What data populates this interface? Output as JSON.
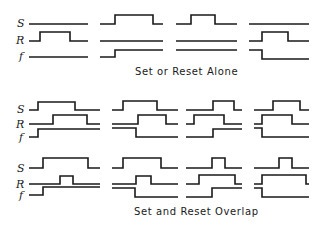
{
  "captions": {
    "top": "Set or Reset Alone",
    "bottom": "Set and Reset Overlap"
  },
  "signal_labels": [
    "S",
    "R",
    "f"
  ],
  "groups": [
    {
      "name": "set-or-reset-alone",
      "label_y": [
        27,
        44,
        60
      ],
      "panels": [
        {
          "S": "M29,24 H88",
          "R": "M29,41 H40 V32 H70 V41 H88",
          "f": "M29,57 H88"
        },
        {
          "S": "M100,24 H115 V15 H153 V24 H163",
          "R": "M100,41 H163",
          "f": "M100,57 H115 V50 H163"
        },
        {
          "S": "M176,24 H191 V15 H215 V24 H237",
          "R": "M176,41 H237",
          "f": "M176,50 H237"
        },
        {
          "S": "M249,24 H309",
          "R": "M249,41 H262 V32 H288 V41 H309",
          "f": "M249,50 H262 V59 H309"
        }
      ]
    },
    {
      "name": "set-reset-middle",
      "label_y": [
        113,
        127,
        140
      ],
      "panels": [
        {
          "S": "M29,110 H38 V102 H75 V110 H100",
          "R": "M29,124 H53 V115 H87 V124 H100",
          "f": "M29,137 H38 V129 H100"
        },
        {
          "S": "M112,110 H123 V101 H157 V110 H178",
          "R": "M112,124 H138 V115 H166 V124 H178",
          "f": "M112,128 H136 V137 H178"
        },
        {
          "S": "M186,110 H213 V101 H234 V110 H242",
          "R": "M186,124 H194 V115 H224 V124 H242",
          "f": "M186,137 H213 V129 H242"
        },
        {
          "S": "M254,110 H273 V101 H300 V110 H309",
          "R": "M254,124 H262 V115 H292 V124 H309",
          "f": "M254,128 H262 V137 H309"
        }
      ]
    },
    {
      "name": "set-and-reset-overlap",
      "label_y": [
        171,
        187,
        198
      ],
      "panels": [
        {
          "S": "M29,168 H43 V158 H88 V168 H100",
          "R": "M29,184 H60 V176 H73 V184 H100",
          "f": "M29,195 H43 V187 H100"
        },
        {
          "S": "M112,168 H123 V158 H161 V168 H178",
          "R": "M112,184 H136 V176 H151 V184 H178",
          "f": "M112,188 H135 V197 H178"
        },
        {
          "S": "M186,168 H212 V158 H225 V168 H242",
          "R": "M186,184 H199 V175 H235 V184 H242",
          "f": "M186,197 H212 V188 H242"
        },
        {
          "S": "M254,168 H279 V158 H292 V168 H309",
          "R": "M254,184 H262 V175 H306 V184 H309",
          "f": "M254,188 H262 V197 H309"
        }
      ]
    }
  ]
}
